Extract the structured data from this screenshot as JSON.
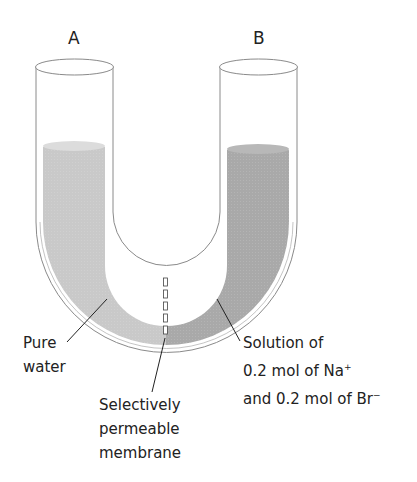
{
  "diagram": {
    "arm_labels": {
      "left": "A",
      "right": "B"
    },
    "labels": {
      "left_liquid": [
        "Pure",
        "water"
      ],
      "membrane": [
        "Selectively",
        "permeable",
        "membrane"
      ],
      "right_liquid": {
        "line1": "Solution of",
        "line2_prefix": "0.2 mol  of Na",
        "line2_sup": "+",
        "line3_prefix": "and 0.2 mol of Br",
        "line3_sup": "−"
      }
    },
    "colors": {
      "tube_outline": "#8a8a8a",
      "pure_water": "#c9c9c9",
      "solution": "#a9a9a9",
      "leader_line": "#222222"
    }
  }
}
